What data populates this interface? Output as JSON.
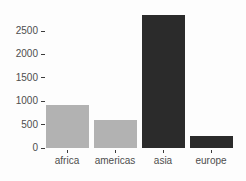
{
  "chart_data": {
    "type": "bar",
    "categories": [
      "africa",
      "americas",
      "asia",
      "europe"
    ],
    "values": [
      920,
      600,
      2840,
      250
    ],
    "bar_colors": [
      "#b2b2b2",
      "#b2b2b2",
      "#2b2b2b",
      "#2b2b2b"
    ],
    "title": "",
    "xlabel": "",
    "ylabel": "",
    "ylim": [
      0,
      2900
    ],
    "yticks": [
      0,
      500,
      1000,
      1500,
      2000,
      2500
    ],
    "grid": false,
    "legend": "none",
    "background_color": "#fdfdfd",
    "axis_text_color": "#4d4d4d"
  }
}
